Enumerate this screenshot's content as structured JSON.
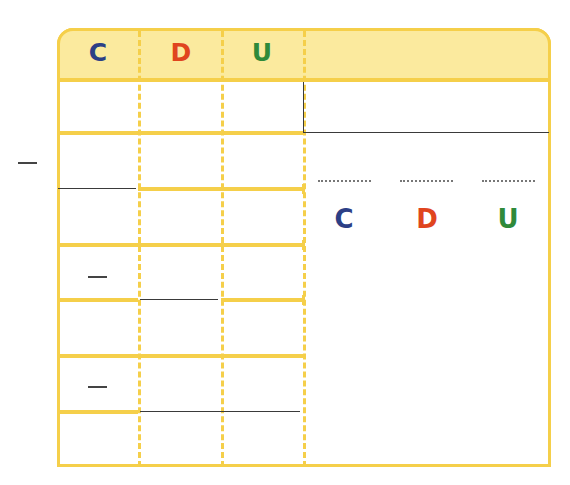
{
  "header": {
    "columns": [
      {
        "label": "C",
        "color": "#2c3f86"
      },
      {
        "label": "D",
        "color": "#e0451e"
      },
      {
        "label": "U",
        "color": "#2f8a3a"
      }
    ]
  },
  "worksheet": {
    "left_operator": "−",
    "row_operators": [
      "−",
      "−"
    ],
    "answer_blanks": [
      "",
      "",
      ""
    ],
    "answer_labels": [
      {
        "label": "C",
        "color": "#2c3f86"
      },
      {
        "label": "D",
        "color": "#e0451e"
      },
      {
        "label": "U",
        "color": "#2f8a3a"
      }
    ]
  },
  "colors": {
    "grid": "#f5cf4a",
    "header_fill": "#fbea9e",
    "ink": "#3a3a3a"
  }
}
